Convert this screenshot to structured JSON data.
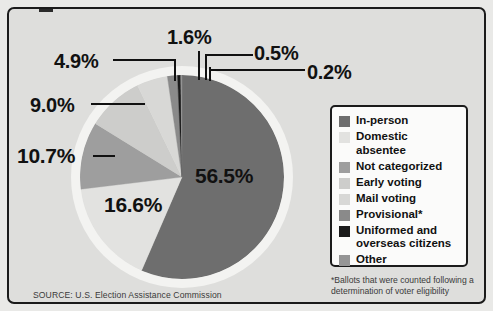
{
  "card": {
    "background_color": "#dededc",
    "border_color": "#1b1b1b"
  },
  "source": {
    "text": "SOURCE: U.S. Election Assistance Commission"
  },
  "footnote": {
    "text": "*Ballots that were counted following a determination of voter eligibility"
  },
  "legend": {
    "items": [
      {
        "label": "In-person",
        "color": "#6e6e6e"
      },
      {
        "label": "Domestic absentee",
        "color": "#e2e2e0"
      },
      {
        "label": "Not categorized",
        "color": "#9e9e9e"
      },
      {
        "label": "Early voting",
        "color": "#cdcdcb"
      },
      {
        "label": "Mail voting",
        "color": "#d8d8d6"
      },
      {
        "label": "Provisional*",
        "color": "#8a8a8a"
      },
      {
        "label": "Uniformed and\noverseas citizens",
        "color": "#1a1a1a"
      },
      {
        "label": "Other",
        "color": "#959595"
      }
    ]
  },
  "labels": {
    "in_person": "56.5%",
    "domestic_absentee": "16.6%",
    "not_categorized": "10.7%",
    "early_voting": "9.0%",
    "mail_voting": "4.9%",
    "provisional": "1.6%",
    "uniformed_overseas": "0.5%",
    "other": "0.2%"
  },
  "chart_data": {
    "type": "pie",
    "title": "",
    "subtitle": "",
    "xlabel": "",
    "ylabel": "",
    "legend_position": "right",
    "grid": false,
    "start_angle_deg": 0,
    "direction": "clockwise",
    "unit": "percent",
    "categories": [
      "In-person",
      "Domestic absentee",
      "Not categorized",
      "Early voting",
      "Mail voting",
      "Provisional*",
      "Uniformed and overseas citizens",
      "Other"
    ],
    "values": [
      56.5,
      16.6,
      10.7,
      9.0,
      4.9,
      1.6,
      0.5,
      0.2
    ],
    "colors": [
      "#6e6e6e",
      "#e2e2e0",
      "#9e9e9e",
      "#cdcdcb",
      "#d8d8d6",
      "#8a8a8a",
      "#1a1a1a",
      "#959595"
    ],
    "data_labels": [
      "56.5%",
      "16.6%",
      "10.7%",
      "9.0%",
      "4.9%",
      "1.6%",
      "0.5%",
      "0.2%"
    ],
    "total": 100.0,
    "annotations": [
      "*Ballots that were counted following a determination of voter eligibility",
      "SOURCE: U.S. Election Assistance Commission"
    ]
  }
}
